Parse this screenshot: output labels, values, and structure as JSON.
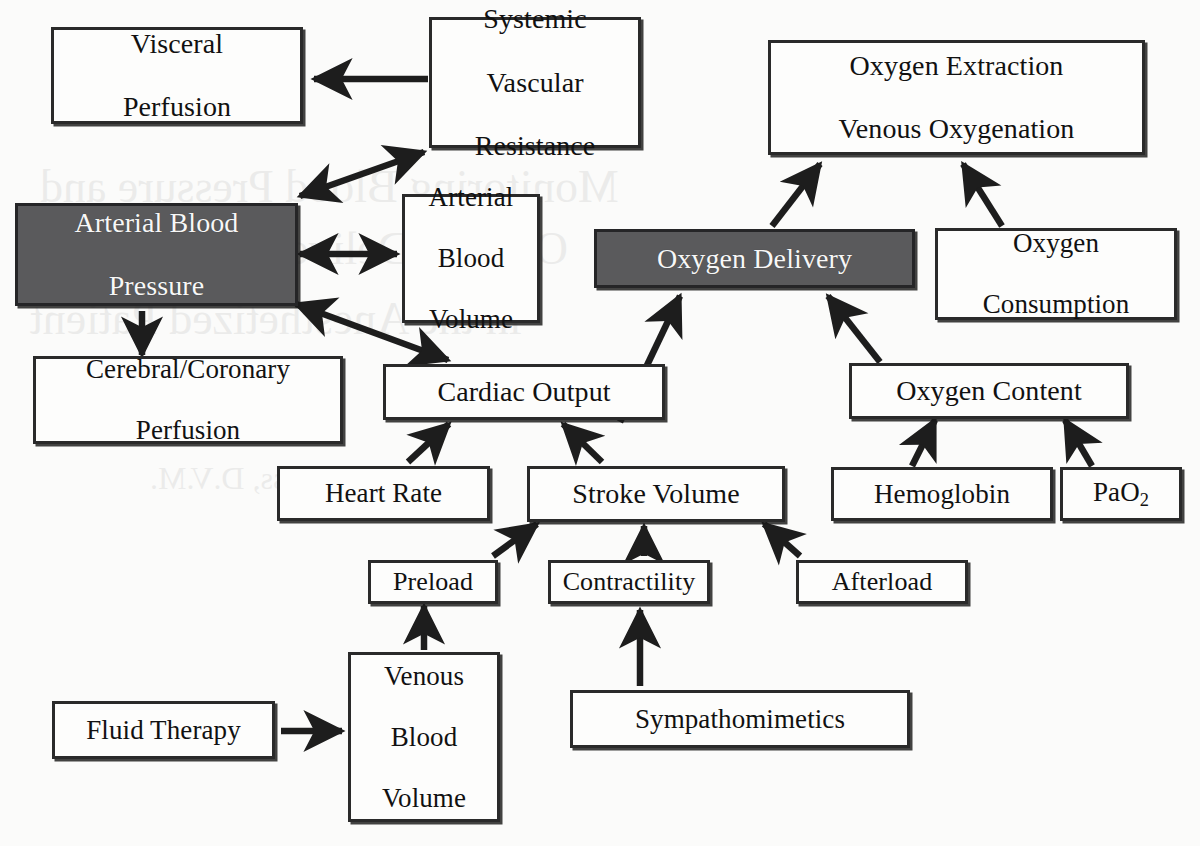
{
  "diagram": {
    "type": "flow-diagram",
    "background_color": "#fbfbfa",
    "highlight_fill": "#5a5a5c",
    "highlight_text_color": "#f7f7f7",
    "node_fill": "#fdfdfc",
    "node_border_color": "#2a2a2a",
    "arrow_color": "#1d1d1d",
    "watermark": {
      "visible": true,
      "note": "faint mirrored bleed-through text from reverse of page",
      "lines": [
        "Monitoring Blood Pressure and",
        "Oxygen Delivery",
        "in the Anesthetized Patient",
        "Robert Reiss, D.V.M."
      ]
    },
    "nodes": [
      {
        "id": "visceral_perfusion",
        "label": "Visceral\nPerfusion",
        "lines": [
          "Visceral",
          "Perfusion"
        ],
        "shaded": false
      },
      {
        "id": "systemic_vascular_resistance",
        "label": "Systemic\nVascular\nResistance",
        "lines": [
          "Systemic",
          "Vascular",
          "Resistance"
        ],
        "shaded": false
      },
      {
        "id": "oxygen_extraction",
        "label": "Oxygen Extraction\nVenous Oxygenation",
        "lines": [
          "Oxygen Extraction",
          "Venous Oxygenation"
        ],
        "shaded": false
      },
      {
        "id": "arterial_blood_pressure",
        "label": "Arterial Blood\nPressure",
        "lines": [
          "Arterial Blood",
          "Pressure"
        ],
        "shaded": true
      },
      {
        "id": "arterial_blood_volume",
        "label": "Arterial\nBlood\nVolume",
        "lines": [
          "Arterial",
          "Blood",
          "Volume"
        ],
        "shaded": false
      },
      {
        "id": "oxygen_delivery",
        "label": "Oxygen Delivery",
        "lines": [
          "Oxygen Delivery"
        ],
        "shaded": true
      },
      {
        "id": "oxygen_consumption",
        "label": "Oxygen\nConsumption",
        "lines": [
          "Oxygen",
          "Consumption"
        ],
        "shaded": false
      },
      {
        "id": "cerebral_coronary_perfusion",
        "label": "Cerebral/Coronary\nPerfusion",
        "lines": [
          "Cerebral/Coronary",
          "Perfusion"
        ],
        "shaded": false
      },
      {
        "id": "cardiac_output",
        "label": "Cardiac Output",
        "lines": [
          "Cardiac Output"
        ],
        "shaded": false
      },
      {
        "id": "oxygen_content",
        "label": "Oxygen Content",
        "lines": [
          "Oxygen Content"
        ],
        "shaded": false
      },
      {
        "id": "heart_rate",
        "label": "Heart Rate",
        "lines": [
          "Heart Rate"
        ],
        "shaded": false
      },
      {
        "id": "stroke_volume",
        "label": "Stroke Volume",
        "lines": [
          "Stroke Volume"
        ],
        "shaded": false
      },
      {
        "id": "hemoglobin",
        "label": "Hemoglobin",
        "lines": [
          "Hemoglobin"
        ],
        "shaded": false
      },
      {
        "id": "pao2",
        "label": "PaO2",
        "lines": [
          "PaO2"
        ],
        "shaded": false
      },
      {
        "id": "preload",
        "label": "Preload",
        "lines": [
          "Preload"
        ],
        "shaded": false
      },
      {
        "id": "contractility",
        "label": "Contractility",
        "lines": [
          "Contractility"
        ],
        "shaded": false
      },
      {
        "id": "afterload",
        "label": "Afterload",
        "lines": [
          "Afterload"
        ],
        "shaded": false
      },
      {
        "id": "fluid_therapy",
        "label": "Fluid Therapy",
        "lines": [
          "Fluid Therapy"
        ],
        "shaded": false
      },
      {
        "id": "venous_blood_volume",
        "label": "Venous\nBlood\nVolume",
        "lines": [
          "Venous",
          "Blood",
          "Volume"
        ],
        "shaded": false
      },
      {
        "id": "sympathomimetics",
        "label": "Sympathomimetics",
        "lines": [
          "Sympathomimetics"
        ],
        "shaded": false
      }
    ],
    "edges": [
      {
        "from": "systemic_vascular_resistance",
        "to": "visceral_perfusion",
        "direction": "single"
      },
      {
        "from": "arterial_blood_pressure",
        "to": "systemic_vascular_resistance",
        "direction": "both"
      },
      {
        "from": "arterial_blood_pressure",
        "to": "arterial_blood_volume",
        "direction": "both"
      },
      {
        "from": "arterial_blood_pressure",
        "to": "cerebral_coronary_perfusion",
        "direction": "single"
      },
      {
        "from": "arterial_blood_pressure",
        "to": "cardiac_output",
        "direction": "both"
      },
      {
        "from": "heart_rate",
        "to": "cardiac_output",
        "direction": "single"
      },
      {
        "from": "stroke_volume",
        "to": "cardiac_output",
        "direction": "single"
      },
      {
        "from": "preload",
        "to": "stroke_volume",
        "direction": "single"
      },
      {
        "from": "contractility",
        "to": "stroke_volume",
        "direction": "single"
      },
      {
        "from": "afterload",
        "to": "stroke_volume",
        "direction": "single"
      },
      {
        "from": "venous_blood_volume",
        "to": "preload",
        "direction": "single"
      },
      {
        "from": "fluid_therapy",
        "to": "venous_blood_volume",
        "direction": "single"
      },
      {
        "from": "sympathomimetics",
        "to": "contractility",
        "direction": "single"
      },
      {
        "from": "cardiac_output",
        "to": "oxygen_delivery",
        "direction": "single"
      },
      {
        "from": "oxygen_content",
        "to": "oxygen_delivery",
        "direction": "single"
      },
      {
        "from": "hemoglobin",
        "to": "oxygen_content",
        "direction": "single"
      },
      {
        "from": "pao2",
        "to": "oxygen_content",
        "direction": "single"
      },
      {
        "from": "oxygen_delivery",
        "to": "oxygen_extraction",
        "direction": "single"
      },
      {
        "from": "oxygen_consumption",
        "to": "oxygen_extraction",
        "direction": "single"
      }
    ]
  }
}
